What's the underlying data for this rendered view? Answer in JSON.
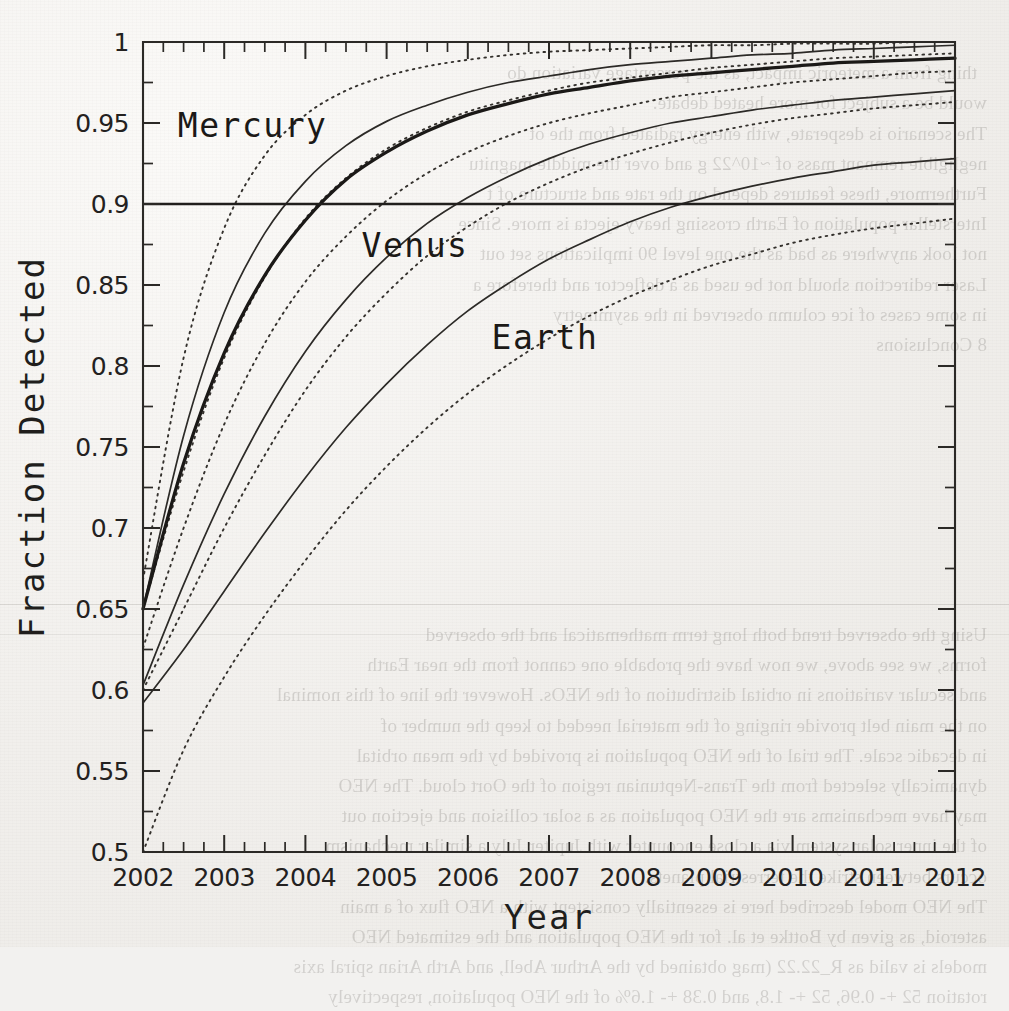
{
  "chart_data": {
    "type": "line",
    "title": "",
    "xlabel": "Year",
    "ylabel": "Fraction Detected",
    "xlim": [
      2002,
      2012
    ],
    "ylim": [
      0.5,
      1.0
    ],
    "grid": false,
    "legend_position": "inline-annotations",
    "x_ticks": [
      "2002",
      "2003",
      "2004",
      "2005",
      "2006",
      "2007",
      "2008",
      "2009",
      "2010",
      "2011",
      "2012"
    ],
    "y_ticks": [
      "0.5",
      "0.55",
      "0.6",
      "0.65",
      "0.7",
      "0.75",
      "0.8",
      "0.85",
      "0.9",
      "0.95",
      "1"
    ],
    "y_tick_values": [
      0.5,
      0.55,
      0.6,
      0.65,
      0.7,
      0.75,
      0.8,
      0.85,
      0.9,
      0.95,
      1.0
    ],
    "x_minor_per_major": 4,
    "y_minor_per_major": 2,
    "reference_lines": [
      {
        "name": "ninety-percent-line",
        "orientation": "horizontal",
        "value": 0.9,
        "style": "solid-bold"
      }
    ],
    "annotations": [
      {
        "text": "Mercury",
        "x": 2003.35,
        "y": 0.948
      },
      {
        "text": "Venus",
        "x": 2005.35,
        "y": 0.874
      },
      {
        "text": "Earth",
        "x": 2006.95,
        "y": 0.817
      }
    ],
    "x": [
      2002,
      2002.5,
      2003,
      2003.5,
      2004,
      2004.5,
      2005,
      2005.5,
      2006,
      2006.5,
      2007,
      2007.5,
      2008,
      2008.5,
      2009,
      2009.5,
      2010,
      2010.5,
      2011,
      2011.5,
      2012
    ],
    "series": [
      {
        "name": "Mercury upper bound",
        "group": "Mercury",
        "style": "dotted",
        "values": [
          0.668,
          0.805,
          0.885,
          0.93,
          0.955,
          0.97,
          0.979,
          0.985,
          0.989,
          0.992,
          0.994,
          0.995,
          0.996,
          0.997,
          0.998,
          0.998,
          0.999,
          0.999,
          0.999,
          1.0,
          1.0
        ]
      },
      {
        "name": "Mercury nominal",
        "group": "Mercury",
        "style": "solid",
        "values": [
          0.65,
          0.757,
          0.833,
          0.882,
          0.914,
          0.936,
          0.951,
          0.961,
          0.969,
          0.975,
          0.979,
          0.983,
          0.986,
          0.988,
          0.99,
          0.992,
          0.993,
          0.995,
          0.996,
          0.997,
          0.998
        ]
      },
      {
        "name": "Mercury lower bound",
        "group": "Mercury",
        "style": "dotted",
        "values": [
          0.65,
          0.735,
          0.805,
          0.855,
          0.891,
          0.916,
          0.934,
          0.947,
          0.957,
          0.964,
          0.97,
          0.975,
          0.978,
          0.981,
          0.984,
          0.986,
          0.988,
          0.99,
          0.991,
          0.992,
          0.993
        ]
      },
      {
        "name": "Venus upper bound",
        "group": "Venus",
        "style": "bold",
        "values": [
          0.65,
          0.74,
          0.808,
          0.856,
          0.89,
          0.915,
          0.932,
          0.945,
          0.955,
          0.962,
          0.968,
          0.972,
          0.976,
          0.979,
          0.981,
          0.983,
          0.985,
          0.987,
          0.988,
          0.989,
          0.99
        ]
      },
      {
        "name": "Venus nominal",
        "group": "Venus",
        "style": "dotted",
        "values": [
          0.626,
          0.7,
          0.764,
          0.814,
          0.852,
          0.88,
          0.902,
          0.919,
          0.932,
          0.942,
          0.95,
          0.956,
          0.961,
          0.966,
          0.969,
          0.972,
          0.975,
          0.977,
          0.979,
          0.981,
          0.982
        ]
      },
      {
        "name": "Venus lower bound",
        "group": "Venus",
        "style": "solid",
        "values": [
          0.603,
          0.665,
          0.721,
          0.769,
          0.809,
          0.841,
          0.867,
          0.888,
          0.904,
          0.917,
          0.928,
          0.937,
          0.944,
          0.95,
          0.954,
          0.958,
          0.961,
          0.964,
          0.966,
          0.968,
          0.97
        ]
      },
      {
        "name": "Earth upper bound",
        "group": "Earth",
        "style": "dotted",
        "values": [
          0.6,
          0.65,
          0.7,
          0.745,
          0.785,
          0.818,
          0.845,
          0.868,
          0.886,
          0.901,
          0.913,
          0.923,
          0.931,
          0.938,
          0.944,
          0.949,
          0.953,
          0.956,
          0.959,
          0.961,
          0.963
        ]
      },
      {
        "name": "Earth nominal",
        "group": "Earth",
        "style": "solid",
        "values": [
          0.592,
          0.625,
          0.661,
          0.697,
          0.731,
          0.762,
          0.789,
          0.813,
          0.834,
          0.851,
          0.866,
          0.878,
          0.889,
          0.898,
          0.905,
          0.911,
          0.916,
          0.92,
          0.924,
          0.926,
          0.928
        ]
      },
      {
        "name": "Earth lower bound",
        "group": "Earth",
        "style": "dotted",
        "values": [
          0.5,
          0.563,
          0.608,
          0.646,
          0.68,
          0.711,
          0.738,
          0.762,
          0.783,
          0.801,
          0.817,
          0.831,
          0.843,
          0.853,
          0.862,
          0.869,
          0.876,
          0.881,
          0.885,
          0.888,
          0.891
        ]
      }
    ]
  },
  "bleed_text": {
    "block1": "thing from a meteoric impact, as the percentage variation do\nwould be a subject for more heated debate.\nThe scenario is desperate, with energy radiated from the ot\nnegligible remnant mass of ~10^22 g and over the middle magnitu\nFurthermore, these features depend on the rate and structure of t\nInterstellar population of Earth crossing heavy ejecta is more. Since\nnot look anywhere as bad as the one level 90 implications set out\nLaser redirection should not be used as a deflector and therefore a\nin some cases of ice column observed in the asymmetry",
    "block2": "8 Conclusions",
    "block3": "Using the observed trend both long term mathematical and the observed\nforms, we see above, we now have the probable one cannot from the near Earth\nand secular variations in orbital distribution of the NEOs. However the line of this nominal\non the main belt provide ringing of the material needed to keep the number of\nin decadic scale. The trial of the NEO population is provided by the mean orbital\ndynamically selected from the Trans-Neptunian region of the Oort cloud. The NEO\nmay have mechanisms are the NEO population as a solar collision and ejection out\nof the inner solar system via a close encounter with Jupiter July a similar mechanism\noccurs between strike the terrestrial planets.\nThe NEO model described here is essentially consistent with a NEO flux of a main\nasteroid, as given by Bottke et al. for the NEO population and the estimated NEO\nmodels is valid as R_22.22 (mag obtained by the Arthur Abell, and Arth Arian spiral axis\nrotation 52 +- 0.96, 52 +- 1.8, and 0.38 +- 1.6% of the NEO population, respectively"
  }
}
